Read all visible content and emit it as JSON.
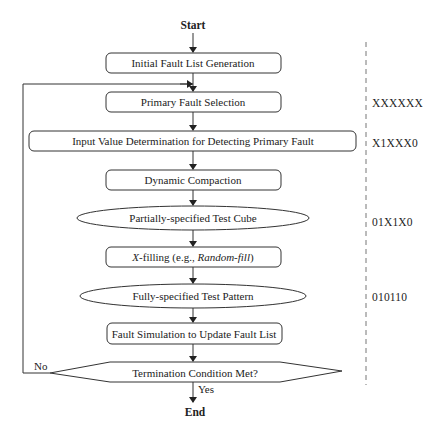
{
  "flowchart": {
    "start": "Start",
    "end": "End",
    "steps": [
      {
        "label": "Initial Fault List Generation",
        "shape": "rounded-rect"
      },
      {
        "label": "Primary Fault Selection",
        "shape": "rounded-rect"
      },
      {
        "label": "Input Value Determination for Detecting Primary Fault",
        "shape": "rounded-rect"
      },
      {
        "label": "Dynamic Compaction",
        "shape": "rounded-rect"
      },
      {
        "label": "Partially-specified Test Cube",
        "shape": "ellipse"
      },
      {
        "label_prefix": "X",
        "label_mid": "-filling (e.g., ",
        "label_italic": "Random-fill",
        "label_suffix": ")",
        "shape": "rounded-rect"
      },
      {
        "label": "Fully-specified Test Pattern",
        "shape": "ellipse"
      },
      {
        "label": "Fault Simulation to Update Fault List",
        "shape": "rounded-rect"
      },
      {
        "label": "Termination Condition Met?",
        "shape": "hexagon"
      }
    ],
    "branches": {
      "no": "No",
      "yes": "Yes"
    },
    "side_values": [
      {
        "step": "Primary Fault Selection",
        "value": "XXXXXX"
      },
      {
        "step": "Input Value Determination for Detecting Primary Fault",
        "value": "X1XXX0"
      },
      {
        "step": "Partially-specified Test Cube",
        "value": "01X1X0"
      },
      {
        "step": "Fully-specified Test Pattern",
        "value": "010110"
      }
    ]
  }
}
